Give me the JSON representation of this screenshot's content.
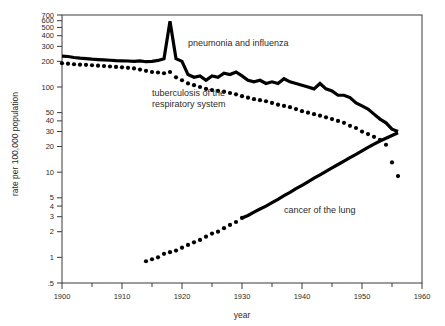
{
  "chart_data": {
    "type": "line",
    "title": "",
    "xlabel": "year",
    "ylabel": "rate per 100,000 population",
    "yscale": "log",
    "ylim": [
      0.5,
      700
    ],
    "xlim": [
      1900,
      1960
    ],
    "grid": false,
    "legend_position": "inline-annotations",
    "x_ticks": [
      1900,
      1910,
      1920,
      1930,
      1940,
      1950,
      1960
    ],
    "x_tick_labels": [
      "1900",
      "1910",
      "1920",
      "1930",
      "1940",
      "1950",
      "1960"
    ],
    "x_minor_ticks": [
      1905,
      1915,
      1925,
      1935,
      1945,
      1955
    ],
    "y_ticks": [
      0.5,
      1,
      2,
      3,
      4,
      5,
      10,
      20,
      30,
      40,
      50,
      100,
      200,
      300,
      400,
      500,
      600,
      700
    ],
    "y_tick_labels": [
      ".5",
      "1",
      "2",
      "3",
      "4",
      "5",
      "10",
      "20",
      "30",
      "40",
      "50",
      "100",
      "200",
      "300",
      "400",
      "500",
      "600",
      "700"
    ],
    "series": [
      {
        "name": "pneumonia and influenza",
        "style": "solid",
        "annotation": "pneumonia and influenza",
        "annotation_x": 1921,
        "annotation_y": 300,
        "x": [
          1900,
          1901,
          1902,
          1903,
          1904,
          1905,
          1906,
          1907,
          1908,
          1909,
          1910,
          1911,
          1912,
          1913,
          1914,
          1915,
          1916,
          1917,
          1918,
          1919,
          1920,
          1921,
          1922,
          1923,
          1924,
          1925,
          1926,
          1927,
          1928,
          1929,
          1930,
          1931,
          1932,
          1933,
          1934,
          1935,
          1936,
          1937,
          1938,
          1939,
          1940,
          1941,
          1942,
          1943,
          1944,
          1945,
          1946,
          1947,
          1948,
          1949,
          1950,
          1951,
          1952,
          1953,
          1954,
          1955,
          1956
        ],
        "y": [
          230,
          228,
          222,
          218,
          215,
          212,
          210,
          208,
          206,
          204,
          203,
          202,
          200,
          202,
          198,
          200,
          205,
          215,
          590,
          215,
          200,
          140,
          130,
          135,
          120,
          135,
          130,
          145,
          140,
          150,
          135,
          120,
          115,
          120,
          110,
          115,
          110,
          125,
          115,
          110,
          105,
          100,
          95,
          110,
          95,
          90,
          80,
          80,
          75,
          65,
          60,
          55,
          48,
          42,
          38,
          32,
          30
        ]
      },
      {
        "name": "tuberculosis of the respiratory system",
        "style": "dotted",
        "annotation": "tuberculosis of the\nrespiratory system",
        "annotation_x": 1915,
        "annotation_y": 78,
        "x": [
          1900,
          1901,
          1902,
          1903,
          1904,
          1905,
          1906,
          1907,
          1908,
          1909,
          1910,
          1911,
          1912,
          1913,
          1914,
          1915,
          1916,
          1917,
          1918,
          1919,
          1920,
          1921,
          1922,
          1923,
          1924,
          1925,
          1926,
          1927,
          1928,
          1929,
          1930,
          1931,
          1932,
          1933,
          1934,
          1935,
          1936,
          1937,
          1938,
          1939,
          1940,
          1941,
          1942,
          1943,
          1944,
          1945,
          1946,
          1947,
          1948,
          1949,
          1950,
          1951,
          1952,
          1953,
          1954,
          1955,
          1956
        ],
        "y": [
          190,
          188,
          185,
          183,
          182,
          180,
          178,
          176,
          174,
          172,
          170,
          168,
          165,
          160,
          155,
          150,
          148,
          145,
          150,
          130,
          120,
          110,
          105,
          100,
          95,
          92,
          90,
          88,
          85,
          82,
          78,
          75,
          72,
          70,
          68,
          65,
          62,
          60,
          58,
          55,
          52,
          50,
          48,
          46,
          44,
          42,
          40,
          38,
          35,
          33,
          30,
          28,
          26,
          24,
          21,
          13,
          9
        ]
      },
      {
        "name": "cancer of the lung",
        "style": "dotted-then-solid",
        "solid_from": 1930,
        "annotation": "cancer of the lung",
        "annotation_x": 1937,
        "annotation_y": 3.3,
        "x": [
          1914,
          1915,
          1916,
          1917,
          1918,
          1919,
          1920,
          1921,
          1922,
          1923,
          1924,
          1925,
          1926,
          1927,
          1928,
          1929,
          1930,
          1931,
          1932,
          1933,
          1934,
          1935,
          1936,
          1937,
          1938,
          1939,
          1940,
          1941,
          1942,
          1943,
          1944,
          1945,
          1946,
          1947,
          1948,
          1949,
          1950,
          1951,
          1952,
          1953,
          1954,
          1955,
          1956
        ],
        "y": [
          0.9,
          0.95,
          1.0,
          1.1,
          1.15,
          1.2,
          1.3,
          1.4,
          1.5,
          1.6,
          1.75,
          1.9,
          2.0,
          2.2,
          2.4,
          2.6,
          2.9,
          3.1,
          3.4,
          3.7,
          4.0,
          4.4,
          4.8,
          5.3,
          5.8,
          6.4,
          7.0,
          7.7,
          8.5,
          9.3,
          10.2,
          11.2,
          12.3,
          13.5,
          14.8,
          16.2,
          17.8,
          19.5,
          21.3,
          23.2,
          25.0,
          27.0,
          29.0
        ]
      }
    ]
  }
}
